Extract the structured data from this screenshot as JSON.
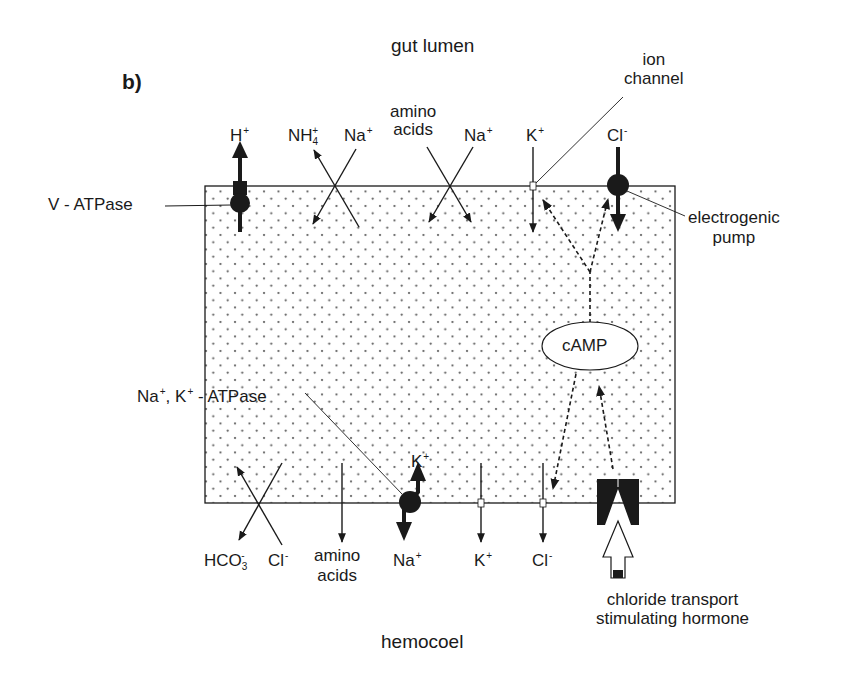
{
  "panel_label": "b)",
  "regions": {
    "top": "gut lumen",
    "bottom": "hemocoel"
  },
  "apical_labels": {
    "h": "H",
    "h_charge": "+",
    "nh4": "NH",
    "nh4_sub": "4",
    "nh4_charge": "+",
    "na1": "Na",
    "na1_charge": "+",
    "amino_1": "amino",
    "amino_2": "acids",
    "na2": "Na",
    "na2_charge": "+",
    "k": "K",
    "k_charge": "+",
    "cl": "Cl",
    "cl_charge": "-"
  },
  "annotations": {
    "ion_channel_1": "ion",
    "ion_channel_2": "channel",
    "v_atpase": "V - ATPase",
    "electrogenic_1": "electrogenic",
    "electrogenic_2": "pump",
    "nak_atpase_na": "Na",
    "nak_atpase_k": ", K",
    "nak_atpase_rest": " - ATPase",
    "plus": "+",
    "camp": "cAMP",
    "hormone_1": "chloride transport",
    "hormone_2": "stimulating hormone"
  },
  "basal_labels": {
    "k_pump": "K",
    "k_pump_charge": "+",
    "hco3": "HCO",
    "hco3_sub": "3",
    "hco3_charge": "-",
    "cl": "Cl",
    "cl_charge": "-",
    "amino_1": "amino",
    "amino_2": "acids",
    "na": "Na",
    "na_charge": "+",
    "k": "K",
    "k_charge": "+",
    "cl2": "Cl",
    "cl2_charge": "-"
  },
  "colors": {
    "ink": "#1a1a1a",
    "cell_fill": "#ffffff",
    "stipple": "#555555"
  }
}
